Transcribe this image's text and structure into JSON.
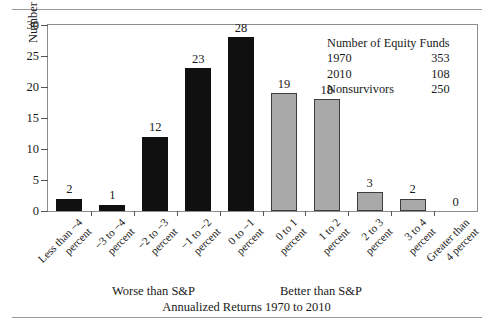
{
  "chart_data": {
    "type": "bar",
    "title": "",
    "xlabel": "Annualized Returns 1970 to 2010",
    "ylabel": "Number of Equity Funds",
    "ylim": [
      0,
      30
    ],
    "yticks": [
      0,
      5,
      10,
      15,
      20,
      25,
      30
    ],
    "grid": false,
    "legend": "none",
    "categories": [
      "Less than −4 percent",
      "−3 to −4 percent",
      "−2 to −3 percent",
      "−1 to −2 percent",
      "0 to −1 percent",
      "0 to 1 percent",
      "1 to 2 percent",
      "2 to 3 percent",
      "3 to 4 percent",
      "Greater than 4 percent"
    ],
    "category_lines": [
      [
        "Less than −4",
        "percent"
      ],
      [
        "−3 to −4",
        "percent"
      ],
      [
        "−2 to −3",
        "percent"
      ],
      [
        "−1 to −2",
        "percent"
      ],
      [
        "0 to −1",
        "percent"
      ],
      [
        "0 to 1",
        "percent"
      ],
      [
        "1 to 2",
        "percent"
      ],
      [
        "2 to 3",
        "percent"
      ],
      [
        "3 to 4",
        "percent"
      ],
      [
        "Greater than",
        "4 percent"
      ]
    ],
    "values": [
      2,
      1,
      12,
      23,
      28,
      19,
      18,
      3,
      2,
      0
    ],
    "bar_colors": [
      "#101010",
      "#101010",
      "#101010",
      "#101010",
      "#101010",
      "#a9a9a9",
      "#a9a9a9",
      "#a9a9a9",
      "#a9a9a9",
      "#a9a9a9"
    ],
    "group_labels": {
      "worse": "Worse than S&P",
      "better": "Better than S&P"
    },
    "annotation": {
      "title": "Number of Equity Funds",
      "rows": [
        {
          "label": "1970",
          "value": "353"
        },
        {
          "label": "2010",
          "value": "108"
        },
        {
          "label": "Nonsurvivors",
          "value": "250"
        }
      ]
    },
    "colors": {
      "dark_bar": "#101010",
      "light_bar": "#a9a9a9",
      "bar_outline": "#3d3d3d",
      "frame": "#8d8d8d",
      "rule": "#9a9a9a",
      "text": "#1a1a1a"
    }
  }
}
